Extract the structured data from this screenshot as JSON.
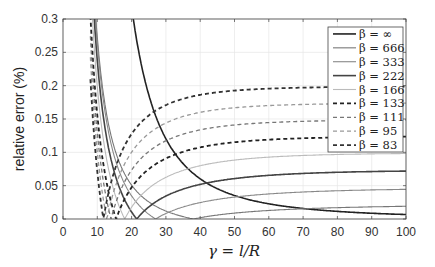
{
  "chart_data": {
    "type": "line",
    "title": "",
    "xlabel": "γ = l/R",
    "ylabel": "relative error (%)",
    "xlim": [
      0,
      100
    ],
    "ylim": [
      0,
      0.3
    ],
    "xticks": [
      0,
      10,
      20,
      30,
      40,
      50,
      60,
      70,
      80,
      90,
      100
    ],
    "yticks": [
      0,
      0.05,
      0.1,
      0.15,
      0.2,
      0.25,
      0.3
    ],
    "xtick_labels": [
      "0",
      "10",
      "20",
      "30",
      "40",
      "50",
      "60",
      "70",
      "80",
      "90",
      "100"
    ],
    "ytick_labels": [
      "0",
      "0.05",
      "0.1",
      "0.15",
      "0.2",
      "0.25",
      "0.3"
    ],
    "grid": true,
    "legend_position": "upper right",
    "series": [
      {
        "name": "β = ∞",
        "label": "β = ∞",
        "color": "#222222",
        "width": 1.6,
        "dash": "",
        "zero": null,
        "plateau": 0.003,
        "A": 0.3,
        "x0": 20.5
      },
      {
        "name": "β = 666",
        "label": "β = 666",
        "color": "#777777",
        "width": 1.1,
        "dash": "",
        "zero": 38,
        "plateau": 0.022
      },
      {
        "name": "β = 333",
        "label": "β = 333",
        "color": "#888888",
        "width": 1.1,
        "dash": "",
        "zero": 27,
        "plateau": 0.047
      },
      {
        "name": "β = 222",
        "label": "β = 222",
        "color": "#444444",
        "width": 1.6,
        "dash": "",
        "zero": 21.5,
        "plateau": 0.074
      },
      {
        "name": "β = 166",
        "label": "β = 166",
        "color": "#bbbbbb",
        "width": 1.1,
        "dash": "",
        "zero": 18,
        "plateau": 0.1
      },
      {
        "name": "β = 133",
        "label": "β = 133",
        "color": "#222222",
        "width": 1.8,
        "dash": "4,3",
        "zero": 15.5,
        "plateau": 0.125
      },
      {
        "name": "β = 111",
        "label": "β = 111",
        "color": "#777777",
        "width": 1.3,
        "dash": "4,3",
        "zero": 14,
        "plateau": 0.15
      },
      {
        "name": "β = 95",
        "label": "β = 95",
        "color": "#999999",
        "width": 1.3,
        "dash": "4,3",
        "zero": 12.8,
        "plateau": 0.175
      },
      {
        "name": "β = 83",
        "label": "β = 83",
        "color": "#333333",
        "width": 1.8,
        "dash": "4,3",
        "zero": 11.8,
        "plateau": 0.2
      }
    ]
  },
  "plot": {
    "left": 63,
    "top": 19,
    "right": 406,
    "bottom": 219
  },
  "legend": {
    "x": 328,
    "y": 27,
    "w": 75,
    "h": 125
  }
}
